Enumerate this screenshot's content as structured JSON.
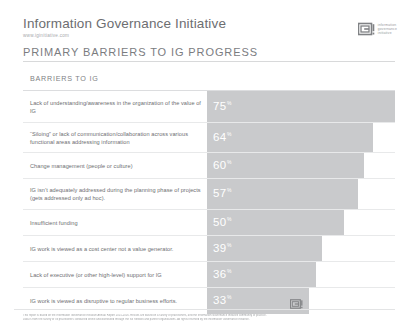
{
  "header": {
    "brand_title": "Information Governance Initiative",
    "brand_url": "www.iginitiative.com",
    "logo_mark": "ig-logo-icon",
    "logo_words_line1": "information",
    "logo_words_line2": "governance",
    "logo_words_line3": "initiative",
    "page_title": "PRIMARY BARRIERS TO IG PROGRESS"
  },
  "table": {
    "column_header": "BARRIERS TO IG",
    "value_suffix": "%"
  },
  "footer": {
    "line1": "This report is based on the Information Governance Initiative Annual Report 2015-2016. Results are based on a survey of practitioners, and the Information Governance Initiative community of practice.",
    "line2": "Data is from the survey of IG practitioners conducted online and distributed through the IGI network and partner organizations. All rights reserved by the Information Governance Initiative."
  },
  "chart_data": {
    "type": "bar",
    "title": "PRIMARY BARRIERS TO IG PROGRESS",
    "xlabel": "",
    "ylabel": "BARRIERS TO IG",
    "xlim": [
      0,
      80
    ],
    "grid": false,
    "legend": "none",
    "orientation": "horizontal",
    "value_unit": "%",
    "bar_color": "#c9cacc",
    "categories": [
      "Lack of understanding/awareness in the organization of the value of IG",
      "“Siloing” or lack of communication/collaboration across various functional areas addressing information",
      "Change management (people or culture)",
      "IG isn’t adequately addressed during the planning phase of projects (gets addressed only ad hoc).",
      "Insufficient funding",
      "IG work is viewed as a cost center not a value generator.",
      "Lack of executive (or other high-level) support for IG",
      "IG work is viewed as disruptive to regular business efforts."
    ],
    "values": [
      75,
      64,
      60,
      57,
      50,
      39,
      36,
      33
    ],
    "rows": [
      {
        "label": "Lack of understanding/awareness in the organization of the value of IG",
        "value": 75,
        "height": 32
      },
      {
        "label": "“Siloing” or lack of communication/collaboration across various functional areas addressing information",
        "value": 64,
        "height": 30
      },
      {
        "label": "Change management (people or culture)",
        "value": 60,
        "height": 26
      },
      {
        "label": "IG isn’t adequately addressed during the planning phase of projects (gets addressed only ad hoc).",
        "value": 57,
        "height": 31
      },
      {
        "label": "Insufficient funding",
        "value": 50,
        "height": 26
      },
      {
        "label": "IG work is viewed as a cost center not a value generator.",
        "value": 39,
        "height": 26
      },
      {
        "label": "Lack of executive (or other high-level) support for IG",
        "value": 36,
        "height": 26
      },
      {
        "label": "IG work is viewed as disruptive to regular business efforts.",
        "value": 33,
        "height": 26
      }
    ]
  }
}
